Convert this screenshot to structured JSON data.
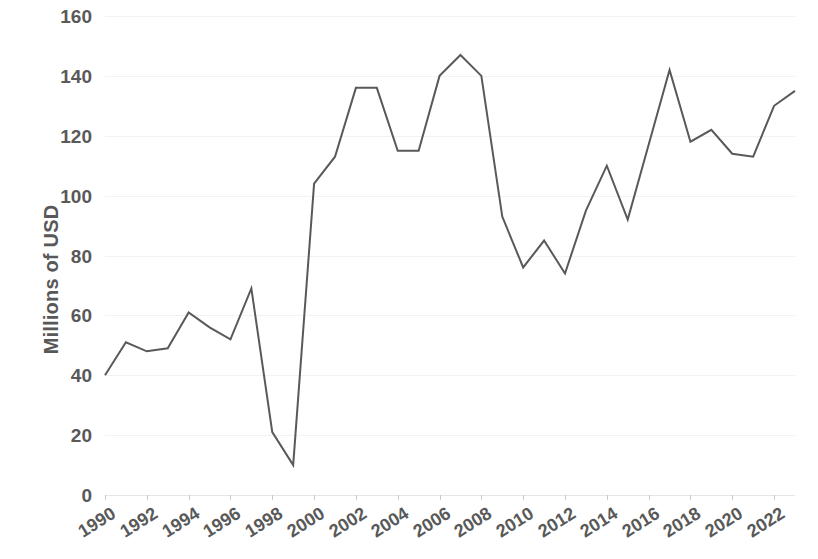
{
  "chart_data": {
    "type": "line",
    "title": "",
    "xlabel": "",
    "ylabel": "Millions of USD",
    "ylim": [
      0,
      160
    ],
    "ytick_labels": [
      "160",
      "140",
      "120",
      "100",
      "80",
      "60",
      "40",
      "20",
      "0"
    ],
    "ytick_values": [
      160,
      140,
      120,
      100,
      80,
      60,
      40,
      20,
      0
    ],
    "xtick_labels": [
      "1990",
      "1992",
      "1994",
      "1996",
      "1998",
      "2000",
      "2002",
      "2004",
      "2006",
      "2008",
      "2010",
      "2012",
      "2014",
      "2016",
      "2018",
      "2020",
      "2022"
    ],
    "xtick_values": [
      1990,
      1992,
      1994,
      1996,
      1998,
      2000,
      2002,
      2004,
      2006,
      2008,
      2010,
      2012,
      2014,
      2016,
      2018,
      2020,
      2022
    ],
    "xlim": [
      1990,
      2023
    ],
    "grid": true,
    "legend": false,
    "legend_position": "none",
    "line_color": "#595959",
    "line_width": 2,
    "categories": [
      1990,
      1991,
      1992,
      1993,
      1994,
      1995,
      1996,
      1997,
      1998,
      1999,
      2000,
      2001,
      2002,
      2003,
      2004,
      2005,
      2006,
      2007,
      2008,
      2009,
      2010,
      2011,
      2012,
      2013,
      2014,
      2015,
      2016,
      2017,
      2018,
      2019,
      2020,
      2021,
      2022,
      2023
    ],
    "values": [
      40,
      51,
      48,
      49,
      61,
      56,
      52,
      69,
      21,
      10,
      104,
      113,
      136,
      136,
      115,
      115,
      140,
      147,
      140,
      93,
      76,
      85,
      74,
      95,
      110,
      92,
      117,
      142,
      118,
      122,
      114,
      113,
      130,
      135
    ],
    "series": [
      {
        "name": "Millions of USD",
        "values": [
          40,
          51,
          48,
          49,
          61,
          56,
          52,
          69,
          21,
          10,
          104,
          113,
          136,
          136,
          115,
          115,
          140,
          147,
          140,
          93,
          76,
          85,
          74,
          95,
          110,
          92,
          117,
          142,
          118,
          122,
          114,
          113,
          130,
          135
        ]
      }
    ]
  }
}
